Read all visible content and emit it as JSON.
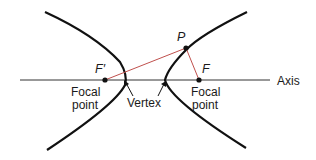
{
  "diagram": {
    "type": "hyperbola",
    "axis_label": "Axis",
    "points": {
      "F_prime": {
        "label": "F′",
        "caption_line1": "Focal",
        "caption_line2": "point"
      },
      "F": {
        "label": "F",
        "caption_line1": "Focal",
        "caption_line2": "point"
      },
      "P": {
        "label": "P"
      }
    },
    "vertex_label": "Vertex",
    "colors": {
      "curve": "#111111",
      "axis": "#333333",
      "focal_lines": "#c0504d",
      "text": "#1a1a1a"
    }
  }
}
